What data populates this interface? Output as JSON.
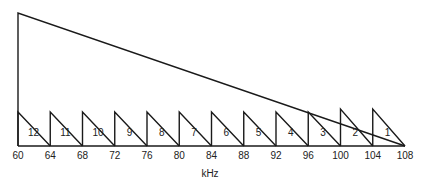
{
  "diagram": {
    "type": "frequency-allocation",
    "axis": {
      "unit_label": "kHz",
      "ticks": [
        "60",
        "64",
        "68",
        "72",
        "76",
        "80",
        "84",
        "88",
        "92",
        "96",
        "100",
        "104",
        "108"
      ]
    },
    "channels": [
      {
        "label": "12",
        "start": 60,
        "end": 64
      },
      {
        "label": "11",
        "start": 64,
        "end": 68
      },
      {
        "label": "10",
        "start": 68,
        "end": 72
      },
      {
        "label": "9",
        "start": 72,
        "end": 76
      },
      {
        "label": "8",
        "start": 76,
        "end": 80
      },
      {
        "label": "7",
        "start": 80,
        "end": 84
      },
      {
        "label": "6",
        "start": 84,
        "end": 88
      },
      {
        "label": "5",
        "start": 88,
        "end": 92
      },
      {
        "label": "4",
        "start": 92,
        "end": 96
      },
      {
        "label": "3",
        "start": 96,
        "end": 100
      },
      {
        "label": "2",
        "start": 100,
        "end": 104
      },
      {
        "label": "1",
        "start": 104,
        "end": 108
      }
    ],
    "group_envelope": {
      "start": 60,
      "end": 108
    }
  }
}
